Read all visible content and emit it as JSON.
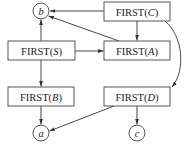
{
  "diagram": {
    "type": "dependency-graph",
    "boxes": [
      {
        "id": "C",
        "prefix": "FIRST(",
        "symbol": "C",
        "suffix": ")",
        "x": 104,
        "y": 2,
        "w": 66,
        "h": 19
      },
      {
        "id": "S",
        "prefix": "FIRST(",
        "symbol": "S",
        "suffix": ")",
        "x": 8,
        "y": 41,
        "w": 67,
        "h": 19
      },
      {
        "id": "A",
        "prefix": "FIRST(",
        "symbol": "A",
        "suffix": ")",
        "x": 104,
        "y": 41,
        "w": 66,
        "h": 19
      },
      {
        "id": "B",
        "prefix": "FIRST(",
        "symbol": "B",
        "suffix": ")",
        "x": 8,
        "y": 87,
        "w": 66,
        "h": 19
      },
      {
        "id": "D",
        "prefix": "FIRST(",
        "symbol": "D",
        "suffix": ")",
        "x": 104,
        "y": 87,
        "w": 66,
        "h": 19
      }
    ],
    "terminals": [
      {
        "id": "b",
        "label": "b",
        "cx": 41,
        "cy": 11,
        "r": 8
      },
      {
        "id": "a",
        "label": "a",
        "cx": 41,
        "cy": 133,
        "r": 8
      },
      {
        "id": "c",
        "label": "c",
        "cx": 137,
        "cy": 133,
        "r": 8
      }
    ],
    "edges": [
      {
        "from": "FIRST(C)",
        "to": "b"
      },
      {
        "from": "FIRST(C)",
        "to": "FIRST(A)"
      },
      {
        "from": "FIRST(A)",
        "to": "b"
      },
      {
        "from": "FIRST(S)",
        "to": "b"
      },
      {
        "from": "FIRST(S)",
        "to": "FIRST(A)"
      },
      {
        "from": "FIRST(S)",
        "to": "FIRST(B)"
      },
      {
        "from": "FIRST(C)",
        "to": "FIRST(D)",
        "style": "curved"
      },
      {
        "from": "FIRST(B)",
        "to": "a"
      },
      {
        "from": "FIRST(D)",
        "to": "a"
      },
      {
        "from": "FIRST(D)",
        "to": "c"
      }
    ]
  },
  "labels": {
    "box_C_prefix": "FIRST(",
    "box_C_symbol": "C",
    "box_C_suffix": ")",
    "box_S_prefix": "FIRST(",
    "box_S_symbol": "S",
    "box_S_suffix": ")",
    "box_A_prefix": "FIRST(",
    "box_A_symbol": "A",
    "box_A_suffix": ")",
    "box_B_prefix": "FIRST(",
    "box_B_symbol": "B",
    "box_B_suffix": ")",
    "box_D_prefix": "FIRST(",
    "box_D_symbol": "D",
    "box_D_suffix": ")",
    "term_b": "b",
    "term_a": "a",
    "term_c": "c"
  }
}
